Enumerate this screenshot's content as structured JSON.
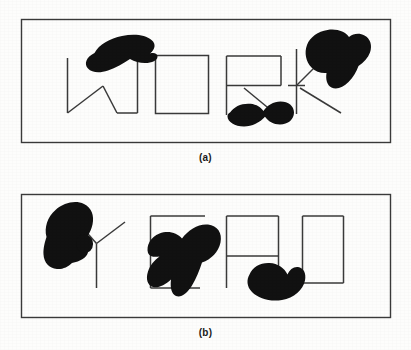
{
  "figure": {
    "background_color": "#fdfdfc",
    "ink_color": "#3a3a3a",
    "blob_color": "#111111",
    "panels": [
      {
        "id": "a",
        "caption": "(a)",
        "word": "WORK",
        "frame": {
          "x": 21,
          "y": 19,
          "width": 369,
          "height": 123
        },
        "letters": [
          {
            "name": "letter-w",
            "glyph": "W"
          },
          {
            "name": "letter-o",
            "glyph": "O"
          },
          {
            "name": "letter-r",
            "glyph": "R"
          },
          {
            "name": "letter-k",
            "glyph": "K"
          }
        ],
        "occluders": [
          {
            "name": "blob-over-w",
            "note": "blob covering top of W"
          },
          {
            "name": "blob-over-r-leg",
            "note": "blob covering lower part of R"
          },
          {
            "name": "blob-over-k",
            "note": "blob covering upper arm of K"
          }
        ]
      },
      {
        "id": "b",
        "caption": "(b)",
        "word": "YEAD",
        "frame": {
          "x": 21,
          "y": 19,
          "width": 369,
          "height": 123
        },
        "letters": [
          {
            "name": "letter-y",
            "glyph": "Y"
          },
          {
            "name": "letter-e",
            "glyph": "E"
          },
          {
            "name": "letter-a",
            "glyph": "A"
          },
          {
            "name": "letter-d",
            "glyph": "D"
          }
        ],
        "occluders": [
          {
            "name": "blob-over-y",
            "note": "large blob covering left arm of Y"
          },
          {
            "name": "blob-dot-near-y",
            "note": "small round blob beside Y"
          },
          {
            "name": "blob-over-e",
            "note": "large blob covering middle of E"
          },
          {
            "name": "blob-over-a-bottom",
            "note": "blob covering bottom of A"
          }
        ]
      }
    ]
  }
}
